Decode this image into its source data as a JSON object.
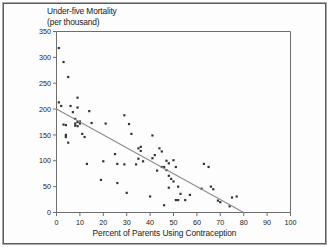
{
  "figure": {
    "title_line1": "Under-five Mortality",
    "title_line2": "(per thousand)",
    "border_color": "#5d5d5d",
    "axis_color": "#6e6e6e",
    "point_color": "#333333",
    "line_color": "#8c8c8c"
  },
  "chart_data": {
    "type": "scatter",
    "title": "Under-five Mortality (per thousand)",
    "xlabel": "Percent of Parents Using Contraception",
    "ylabel": "Under-five Mortality (per thousand)",
    "xlim": [
      0,
      100
    ],
    "ylim": [
      0,
      350
    ],
    "xticks": [
      0,
      10,
      20,
      30,
      40,
      50,
      60,
      70,
      80,
      90,
      100
    ],
    "yticks": [
      0,
      50,
      100,
      150,
      200,
      250,
      300,
      350
    ],
    "grid": false,
    "legend": "none",
    "series": [
      {
        "name": "Countries",
        "marker": "square",
        "points": [
          [
            1,
            318
          ],
          [
            1,
            213
          ],
          [
            2,
            206
          ],
          [
            3,
            291
          ],
          [
            3,
            170
          ],
          [
            4,
            169
          ],
          [
            4,
            150
          ],
          [
            4,
            146
          ],
          [
            5,
            262
          ],
          [
            5,
            135
          ],
          [
            6,
            206
          ],
          [
            7,
            194
          ],
          [
            8,
            181
          ],
          [
            8,
            172
          ],
          [
            8,
            168
          ],
          [
            9,
            222
          ],
          [
            9,
            203
          ],
          [
            9,
            175
          ],
          [
            9,
            167
          ],
          [
            10,
            176
          ],
          [
            10,
            172
          ],
          [
            11,
            152
          ],
          [
            12,
            146
          ],
          [
            13,
            94
          ],
          [
            14,
            196
          ],
          [
            15,
            173
          ],
          [
            19,
            63
          ],
          [
            20,
            99
          ],
          [
            21,
            172
          ],
          [
            25,
            113
          ],
          [
            26,
            94
          ],
          [
            26,
            57
          ],
          [
            29,
            188
          ],
          [
            29,
            93
          ],
          [
            30,
            38
          ],
          [
            31,
            171
          ],
          [
            32,
            152
          ],
          [
            34,
            93
          ],
          [
            35,
            124
          ],
          [
            35,
            104
          ],
          [
            36,
            127
          ],
          [
            36,
            119
          ],
          [
            37,
            99
          ],
          [
            40,
            31
          ],
          [
            41,
            149
          ],
          [
            41,
            105
          ],
          [
            42,
            111
          ],
          [
            43,
            81
          ],
          [
            44,
            124
          ],
          [
            45,
            118
          ],
          [
            45,
            88
          ],
          [
            46,
            14
          ],
          [
            46,
            88
          ],
          [
            47,
            100
          ],
          [
            47,
            82
          ],
          [
            48,
            95
          ],
          [
            48,
            71
          ],
          [
            48,
            48
          ],
          [
            49,
            65
          ],
          [
            50,
            101
          ],
          [
            50,
            60
          ],
          [
            51,
            24
          ],
          [
            51,
            88
          ],
          [
            52,
            50
          ],
          [
            52,
            24
          ],
          [
            53,
            36
          ],
          [
            55,
            24
          ],
          [
            57,
            34
          ],
          [
            62,
            46
          ],
          [
            63,
            94
          ],
          [
            65,
            88
          ],
          [
            66,
            50
          ],
          [
            67,
            45
          ],
          [
            69,
            23
          ],
          [
            70,
            20
          ],
          [
            74,
            12
          ],
          [
            75,
            29
          ],
          [
            77,
            31
          ]
        ]
      },
      {
        "name": "Regression line",
        "type": "line",
        "points": [
          [
            0,
            200
          ],
          [
            80,
            0
          ]
        ]
      }
    ]
  },
  "axis_labels": {
    "x": [
      "0",
      "10",
      "20",
      "30",
      "40",
      "50",
      "60",
      "70",
      "80",
      "90",
      "100"
    ],
    "y": [
      "0",
      "50",
      "100",
      "150",
      "200",
      "250",
      "300",
      "350"
    ]
  }
}
